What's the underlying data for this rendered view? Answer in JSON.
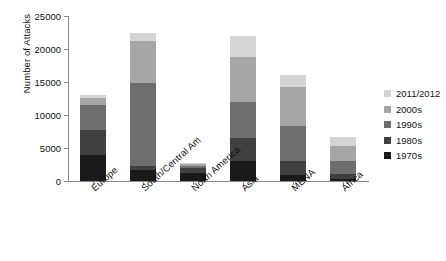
{
  "chart_data": {
    "type": "bar",
    "subtype": "stacked-vertical",
    "title": "",
    "xlabel": "",
    "ylabel": "Number of Attacks",
    "ylim": [
      0,
      25000
    ],
    "yticks": [
      0,
      5000,
      10000,
      15000,
      20000,
      25000
    ],
    "ytick_labels": [
      "0",
      "5000",
      "10000",
      "15000",
      "20000",
      "25000"
    ],
    "grid": false,
    "legend_position": "right",
    "categories": [
      "Europe",
      "South/Central Am",
      "North America",
      "Asia",
      "MENA",
      "Africa"
    ],
    "series": [
      {
        "name": "1970s",
        "color": "#1a1a1a",
        "values": [
          4000,
          1700,
          1200,
          3100,
          900,
          300
        ]
      },
      {
        "name": "1980s",
        "color": "#404040",
        "values": [
          3700,
          500,
          700,
          3400,
          2200,
          700
        ]
      },
      {
        "name": "1990s",
        "color": "#6e6e6e",
        "values": [
          3800,
          12600,
          400,
          5500,
          5200,
          2000
        ]
      },
      {
        "name": "2000s",
        "color": "#a6a6a6",
        "values": [
          1100,
          6400,
          300,
          6800,
          6000,
          2300
        ]
      },
      {
        "name": "2011/2012",
        "color": "#d4d4d4",
        "values": [
          400,
          1300,
          100,
          3200,
          1700,
          1400
        ]
      }
    ],
    "totals": [
      13000,
      22500,
      2700,
      22000,
      16000,
      6700
    ],
    "legend_entries": [
      {
        "label": "2011/2012",
        "color": "#d4d4d4"
      },
      {
        "label": "2000s",
        "color": "#a6a6a6"
      },
      {
        "label": "1990s",
        "color": "#6e6e6e"
      },
      {
        "label": "1980s",
        "color": "#404040"
      },
      {
        "label": "1970s",
        "color": "#1a1a1a"
      }
    ]
  },
  "axes": {
    "y_title": "Number of Attacks"
  }
}
